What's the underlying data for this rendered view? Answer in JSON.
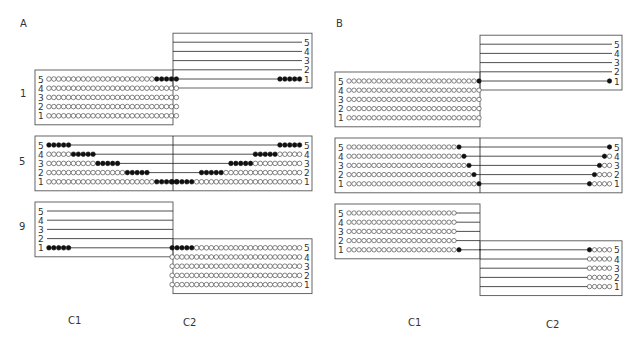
{
  "figure": {
    "panels": [
      {
        "label": "A",
        "column_labels": [
          "C1",
          "C2"
        ],
        "conditions": [
          {
            "label": "1",
            "layout": "offset-up",
            "c1_rows": [
              {
                "line": "5",
                "open": 22,
                "filled": 5
              },
              {
                "line": "4",
                "open": 27,
                "filled": 0
              },
              {
                "line": "3",
                "open": 27,
                "filled": 0
              },
              {
                "line": "2",
                "open": 27,
                "filled": 0
              },
              {
                "line": "1",
                "open": 27,
                "filled": 0
              }
            ],
            "c2_rows": [
              {
                "line": "5",
                "open": 0,
                "filled": 0
              },
              {
                "line": "4",
                "open": 0,
                "filled": 0
              },
              {
                "line": "3",
                "open": 0,
                "filled": 0
              },
              {
                "line": "2",
                "open": 0,
                "filled": 0
              },
              {
                "line": "1",
                "open": 0,
                "filled": 5
              }
            ]
          },
          {
            "label": "5",
            "layout": "aligned",
            "c1_rows": [
              {
                "line": "5",
                "open": 0,
                "filled": 5
              },
              {
                "line": "4",
                "open": 5,
                "filled": 5
              },
              {
                "line": "3",
                "open": 10,
                "filled": 5
              },
              {
                "line": "2",
                "open": 16,
                "filled": 5
              },
              {
                "line": "1",
                "open": 22,
                "filled": 5
              }
            ],
            "c2_rows": [
              {
                "line": "5",
                "open": 0,
                "filled": 5
              },
              {
                "line": "4",
                "open": 5,
                "filled": 5
              },
              {
                "line": "3",
                "open": 10,
                "filled": 5
              },
              {
                "line": "2",
                "open": 16,
                "filled": 5
              },
              {
                "line": "1",
                "open": 22,
                "filled": 5
              }
            ]
          },
          {
            "label": "9",
            "layout": "offset-down",
            "c1_rows": [
              {
                "line": "5",
                "open": 0,
                "filled": 0
              },
              {
                "line": "4",
                "open": 0,
                "filled": 0
              },
              {
                "line": "3",
                "open": 0,
                "filled": 0
              },
              {
                "line": "2",
                "open": 0,
                "filled": 0
              },
              {
                "line": "1",
                "open": 0,
                "filled": 5
              }
            ],
            "c2_rows": [
              {
                "line": "5",
                "open": 22,
                "filled": 5
              },
              {
                "line": "4",
                "open": 27,
                "filled": 0
              },
              {
                "line": "3",
                "open": 27,
                "filled": 0
              },
              {
                "line": "2",
                "open": 27,
                "filled": 0
              },
              {
                "line": "1",
                "open": 27,
                "filled": 0
              }
            ]
          }
        ]
      },
      {
        "label": "B",
        "column_labels": [
          "C1",
          "C2"
        ],
        "conditions": [
          {
            "label": "",
            "layout": "offset-up",
            "c1_rows": [
              {
                "line": "5",
                "open": 26,
                "filled": 1
              },
              {
                "line": "4",
                "open": 27,
                "filled": 0
              },
              {
                "line": "3",
                "open": 27,
                "filled": 0
              },
              {
                "line": "2",
                "open": 27,
                "filled": 0
              },
              {
                "line": "1",
                "open": 27,
                "filled": 0
              }
            ],
            "c2_rows": [
              {
                "line": "5",
                "open": 0,
                "filled": 0
              },
              {
                "line": "4",
                "open": 0,
                "filled": 0
              },
              {
                "line": "3",
                "open": 0,
                "filled": 0
              },
              {
                "line": "2",
                "open": 0,
                "filled": 0
              },
              {
                "line": "1",
                "open": 0,
                "filled": 1
              }
            ]
          },
          {
            "label": "",
            "layout": "aligned",
            "c1_rows": [
              {
                "line": "5",
                "open": 22,
                "filled": 1
              },
              {
                "line": "4",
                "open": 23,
                "filled": 1
              },
              {
                "line": "3",
                "open": 24,
                "filled": 1
              },
              {
                "line": "2",
                "open": 25,
                "filled": 1
              },
              {
                "line": "1",
                "open": 26,
                "filled": 1
              }
            ],
            "c2_rows": [
              {
                "line": "5",
                "open": 0,
                "filled": 1
              },
              {
                "line": "4",
                "open": 1,
                "filled": 1
              },
              {
                "line": "3",
                "open": 2,
                "filled": 1
              },
              {
                "line": "2",
                "open": 3,
                "filled": 1
              },
              {
                "line": "1",
                "open": 4,
                "filled": 1
              }
            ]
          },
          {
            "label": "",
            "layout": "offset-down",
            "c1_rows": [
              {
                "line": "5",
                "open": 22,
                "filled": 0
              },
              {
                "line": "4",
                "open": 22,
                "filled": 0
              },
              {
                "line": "3",
                "open": 22,
                "filled": 0
              },
              {
                "line": "2",
                "open": 22,
                "filled": 0
              },
              {
                "line": "1",
                "open": 22,
                "filled": 1
              }
            ],
            "c2_rows": [
              {
                "line": "5",
                "open": 4,
                "filled": 1
              },
              {
                "line": "4",
                "open": 5,
                "filled": 0
              },
              {
                "line": "3",
                "open": 5,
                "filled": 0
              },
              {
                "line": "2",
                "open": 5,
                "filled": 0
              },
              {
                "line": "1",
                "open": 5,
                "filled": 0
              }
            ]
          }
        ]
      }
    ]
  }
}
